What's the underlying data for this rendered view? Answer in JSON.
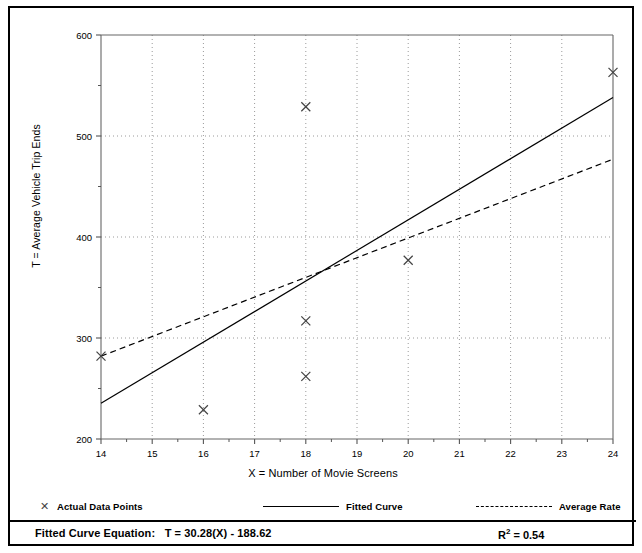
{
  "figure": {
    "border_color": "#000000",
    "background": "#ffffff"
  },
  "axis": {
    "y_title": "T = Average Vehicle Trip Ends",
    "x_title": "X = Number of Movie Screens"
  },
  "legend": {
    "entries": [
      {
        "label": "Actual Data Points",
        "marker": "x-marker-icon",
        "style": "marker"
      },
      {
        "label": "Fitted Curve",
        "marker": "solid-line-icon",
        "style": "solid"
      },
      {
        "label": "Average Rate",
        "marker": "dashed-line-icon",
        "style": "dashed"
      }
    ]
  },
  "footer": {
    "equation_label": "Fitted Curve Equation:",
    "equation": "T = 30.28(X) - 188.62",
    "r_squared_symbol": "R",
    "r_squared_exponent": "2",
    "r_squared_value": "= 0.54"
  },
  "chart_data": {
    "type": "scatter",
    "title": "",
    "xlabel": "X = Number of Movie Screens",
    "ylabel": "T = Average Vehicle Trip Ends",
    "xlim": [
      14,
      24
    ],
    "ylim": [
      200,
      600
    ],
    "xticks": [
      14,
      15,
      16,
      17,
      18,
      19,
      20,
      21,
      22,
      23,
      24
    ],
    "yticks": [
      200,
      300,
      400,
      500,
      600
    ],
    "y_minor_ticks": [
      250,
      350,
      450,
      550
    ],
    "x_minor_ticks": [
      14.5,
      15.5,
      16.5,
      17.5,
      18.5,
      19.5,
      20.5,
      21.5,
      22.5,
      23.5
    ],
    "xtick_labels": [
      "14",
      "15",
      "16",
      "17",
      "18",
      "19",
      "20",
      "21",
      "22",
      "23",
      "24"
    ],
    "ytick_labels": [
      "200",
      "300",
      "400",
      "500",
      "600"
    ],
    "grid": "dotted-vertical-and-horizontal",
    "legend_position": "below-axes",
    "series": [
      {
        "name": "Actual Data Points",
        "type": "scatter",
        "marker": "x",
        "color": "#444444",
        "points": [
          {
            "x": 14,
            "y": 282
          },
          {
            "x": 16,
            "y": 229
          },
          {
            "x": 18,
            "y": 529
          },
          {
            "x": 18,
            "y": 317
          },
          {
            "x": 18,
            "y": 262
          },
          {
            "x": 20,
            "y": 377
          },
          {
            "x": 24,
            "y": 563
          }
        ]
      },
      {
        "name": "Fitted Curve",
        "type": "line",
        "style": "solid",
        "color": "#000000",
        "equation": "T = 30.28(X) - 188.62",
        "slope": 30.28,
        "intercept": -188.62,
        "endpoints": [
          {
            "x": 14,
            "y": 235.3
          },
          {
            "x": 24,
            "y": 538.1
          }
        ]
      },
      {
        "name": "Average Rate",
        "type": "line",
        "style": "dashed",
        "color": "#000000",
        "endpoints": [
          {
            "x": 14,
            "y": 282
          },
          {
            "x": 24,
            "y": 477
          }
        ]
      }
    ],
    "annotations": [
      {
        "text": "Fitted Curve Equation:  T = 30.28(X) - 188.62",
        "position": "bottom-left"
      },
      {
        "text": "R2 = 0.54",
        "position": "bottom-right"
      }
    ]
  }
}
